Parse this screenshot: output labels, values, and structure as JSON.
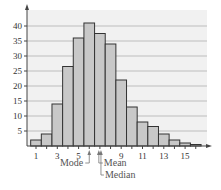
{
  "chart_data": {
    "type": "bar",
    "title": "",
    "xlabel": "",
    "ylabel": "",
    "categories": [
      1,
      2,
      3,
      4,
      5,
      6,
      7,
      8,
      9,
      10,
      11,
      12,
      13,
      14,
      15,
      16
    ],
    "values": [
      2,
      4,
      14,
      26.5,
      36,
      41,
      37.5,
      34,
      22,
      13,
      8,
      6.5,
      4,
      2,
      1,
      0.5
    ],
    "xticks": [
      "1",
      "3",
      "5",
      "9",
      "11",
      "13",
      "15"
    ],
    "yticks": [
      "5",
      "10",
      "15",
      "20",
      "25",
      "30",
      "35",
      "40"
    ],
    "ylim": [
      0,
      45
    ],
    "grid": true,
    "legend": null,
    "bar_color": "#c8c8c8",
    "bar_edge": "#333333",
    "annotations": [
      {
        "label": "Mode",
        "x": 6
      },
      {
        "label": "Mean",
        "x": 6.9
      },
      {
        "label": "Median",
        "x": 7.1
      }
    ]
  }
}
